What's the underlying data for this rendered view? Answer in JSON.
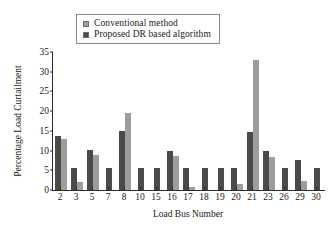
{
  "chart_data": {
    "type": "bar",
    "title": "",
    "xlabel": "Load Bus Number",
    "ylabel": "Percentage Load Curtailment",
    "categories": [
      "2",
      "3",
      "5",
      "7",
      "8",
      "10",
      "15",
      "16",
      "17",
      "18",
      "19",
      "20",
      "21",
      "23",
      "26",
      "29",
      "30"
    ],
    "ylim": [
      0,
      35
    ],
    "yticks": [
      "0",
      "5",
      "10",
      "15",
      "20",
      "25",
      "30",
      "35"
    ],
    "grid": false,
    "legend_position": "top-center",
    "series": [
      {
        "name": "Proposed DR based algorithm",
        "color": "#4a4a4a",
        "values": [
          13.8,
          5.7,
          10.2,
          5.7,
          15.0,
          5.7,
          5.7,
          9.8,
          5.7,
          5.7,
          5.7,
          5.7,
          14.8,
          10.0,
          5.5,
          7.6,
          5.5
        ]
      },
      {
        "name": "Conventional method",
        "color": "#9d9d9d",
        "values": [
          13.0,
          2.0,
          8.8,
          0,
          19.5,
          0,
          0,
          8.7,
          0.8,
          0,
          0,
          1.5,
          33.0,
          8.5,
          0,
          2.2,
          0
        ]
      }
    ]
  },
  "legend": {
    "items": [
      {
        "label": "Conventional method",
        "color": "#9d9d9d"
      },
      {
        "label": "Proposed DR based algorithm",
        "color": "#4a4a4a"
      }
    ]
  }
}
